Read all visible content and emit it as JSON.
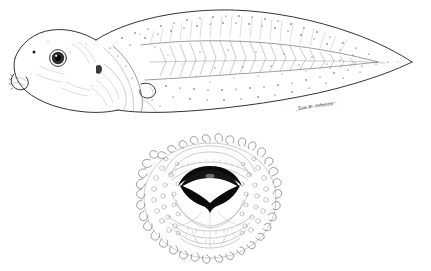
{
  "figure": {
    "background_color": "#ffffff",
    "ink_color": "#1d1d1d",
    "width": 431,
    "height": 271
  },
  "panels": [
    {
      "id": "lateral-view",
      "label": "Tadpole lateral view",
      "subject": "tadpole",
      "orientation": "left-facing",
      "parts": [
        {
          "name": "head",
          "label": "Head"
        },
        {
          "name": "eye",
          "label": "Eye"
        },
        {
          "name": "nostril",
          "label": "Nostril"
        },
        {
          "name": "oral-disc",
          "label": "Oral disc"
        },
        {
          "name": "spiracle",
          "label": "Spiracle"
        },
        {
          "name": "body",
          "label": "Body"
        },
        {
          "name": "myotomes",
          "label": "Myotomes"
        },
        {
          "name": "dorsal-fin",
          "label": "Dorsal fin"
        },
        {
          "name": "ventral-fin",
          "label": "Ventral fin"
        },
        {
          "name": "tail-musculature",
          "label": "Tail musculature"
        },
        {
          "name": "tail-tip",
          "label": "Tail tip"
        }
      ]
    },
    {
      "id": "oral-disc-detail",
      "label": "Oral disc detail",
      "subject": "mouthparts",
      "orientation": "anterior",
      "parts": [
        {
          "name": "marginal-papillae",
          "label": "Marginal papillae"
        },
        {
          "name": "submarginal-papillae",
          "label": "Submarginal papillae"
        },
        {
          "name": "upper-labium",
          "label": "Upper labium"
        },
        {
          "name": "lower-labium",
          "label": "Lower labium"
        },
        {
          "name": "upper-jaw-sheath",
          "label": "Upper jaw sheath"
        },
        {
          "name": "lower-jaw-sheath",
          "label": "Lower jaw sheath"
        },
        {
          "name": "anterior-tooth-rows",
          "label": "Anterior tooth rows"
        },
        {
          "name": "posterior-tooth-rows",
          "label": "Posterior tooth rows"
        }
      ]
    }
  ],
  "signature": {
    "text": "Tom R. Johnson",
    "style": "handwritten-cursive"
  },
  "colors": {
    "ink": "#1d1d1d",
    "soft_ink": "#5c5c5c",
    "hairline": "#8a8a8a",
    "beak_black": "#0a0a0a",
    "paper": "#ffffff"
  }
}
